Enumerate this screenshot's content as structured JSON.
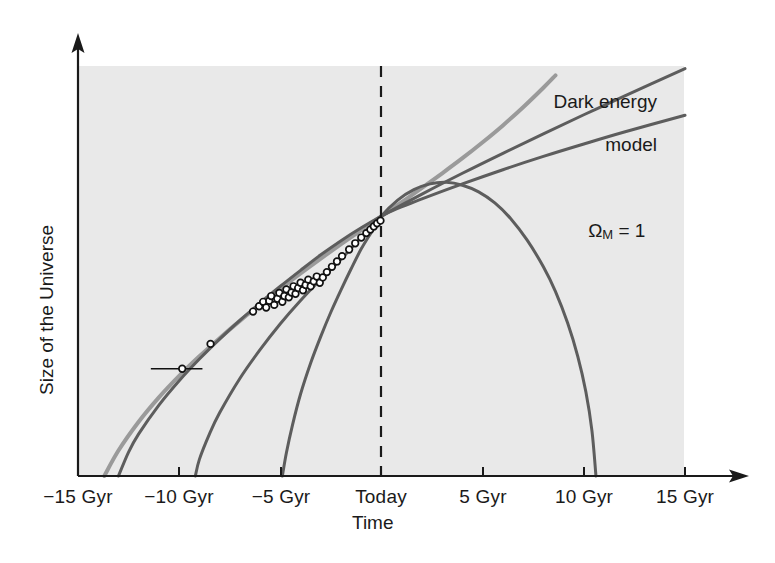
{
  "chart_data": {
    "type": "line",
    "title": "",
    "xlabel": "Time",
    "ylabel": "Size of the Universe",
    "xtick_labels": [
      "-15 Gyr",
      "-10 Gyr",
      "-5 Gyr",
      "Today",
      "5 Gyr",
      "10 Gyr",
      "15 Gyr"
    ],
    "xtick_values": [
      -15,
      -10,
      -5,
      0,
      5,
      10,
      15
    ],
    "xlim": [
      -15,
      15
    ],
    "ylim": [
      0,
      1.85
    ],
    "grid": false,
    "legend_position": "inline-annotations",
    "annotations": [
      {
        "name": "dark-energy-model",
        "text_line1": "Dark energy",
        "text_line2": "model",
        "at_x": 11.0,
        "at_y": 1.62
      },
      {
        "name": "omega-m-1",
        "text_prefix": "Ω",
        "text_sub": "M",
        "text_suffix": " = 1",
        "at_x": 13.0,
        "at_y": 1.02
      }
    ],
    "reference_line": {
      "name": "today-line",
      "x": 0,
      "style": "dashed",
      "label": "Today"
    },
    "series": [
      {
        "name": "Dark energy model",
        "color": "#9a9a9a",
        "style": "solid",
        "width": 4,
        "points": [
          [
            -13.7,
            0.0
          ],
          [
            -13.0,
            0.115
          ],
          [
            -12.0,
            0.245
          ],
          [
            -11.0,
            0.355
          ],
          [
            -10.0,
            0.452
          ],
          [
            -9.0,
            0.54
          ],
          [
            -8.0,
            0.622
          ],
          [
            -7.0,
            0.7
          ],
          [
            -6.0,
            0.774
          ],
          [
            -5.0,
            0.845
          ],
          [
            -4.0,
            0.914
          ],
          [
            -3.0,
            0.981
          ],
          [
            -2.0,
            1.046
          ],
          [
            -1.0,
            1.11
          ],
          [
            0.0,
            1.173
          ],
          [
            1.0,
            1.236
          ],
          [
            2.0,
            1.3
          ],
          [
            3.0,
            1.366
          ],
          [
            4.0,
            1.434
          ],
          [
            5.0,
            1.506
          ],
          [
            6.0,
            1.582
          ],
          [
            7.0,
            1.664
          ],
          [
            8.0,
            1.752
          ],
          [
            8.6,
            1.808
          ]
        ]
      },
      {
        "name": "Open / low density universe",
        "color": "#5d5d5d",
        "style": "solid",
        "width": 3,
        "points": [
          [
            -13.0,
            0.0
          ],
          [
            -12.5,
            0.108
          ],
          [
            -12.0,
            0.19
          ],
          [
            -11.0,
            0.32
          ],
          [
            -10.0,
            0.43
          ],
          [
            -9.0,
            0.528
          ],
          [
            -8.0,
            0.618
          ],
          [
            -7.0,
            0.702
          ],
          [
            -6.0,
            0.781
          ],
          [
            -5.0,
            0.856
          ],
          [
            -4.0,
            0.928
          ],
          [
            -3.0,
            0.998
          ],
          [
            -2.0,
            1.062
          ],
          [
            -1.0,
            1.12
          ],
          [
            0.0,
            1.173
          ],
          [
            2.0,
            1.272
          ],
          [
            4.0,
            1.366
          ],
          [
            6.0,
            1.456
          ],
          [
            8.0,
            1.544
          ],
          [
            10.0,
            1.63
          ],
          [
            12.0,
            1.714
          ],
          [
            15.0,
            1.838
          ]
        ]
      },
      {
        "name": "Omega_M = 1 critical universe",
        "color": "#5d5d5d",
        "style": "solid",
        "width": 3,
        "points": [
          [
            -9.2,
            0.0
          ],
          [
            -9.0,
            0.075
          ],
          [
            -8.5,
            0.19
          ],
          [
            -8.0,
            0.285
          ],
          [
            -7.0,
            0.44
          ],
          [
            -6.0,
            0.57
          ],
          [
            -5.0,
            0.687
          ],
          [
            -4.0,
            0.792
          ],
          [
            -3.0,
            0.888
          ],
          [
            -2.0,
            0.978
          ],
          [
            -1.0,
            1.078
          ],
          [
            0.0,
            1.173
          ],
          [
            2.0,
            1.25
          ],
          [
            4.0,
            1.318
          ],
          [
            6.0,
            1.382
          ],
          [
            8.0,
            1.442
          ],
          [
            10.0,
            1.498
          ],
          [
            12.0,
            1.552
          ],
          [
            15.0,
            1.628
          ]
        ]
      },
      {
        "name": "Closed / high density universe",
        "color": "#5d5d5d",
        "style": "solid",
        "width": 3,
        "points": [
          [
            -4.9,
            0.0
          ],
          [
            -4.7,
            0.105
          ],
          [
            -4.4,
            0.23
          ],
          [
            -4.0,
            0.37
          ],
          [
            -3.5,
            0.51
          ],
          [
            -3.0,
            0.63
          ],
          [
            -2.5,
            0.74
          ],
          [
            -2.0,
            0.84
          ],
          [
            -1.5,
            0.935
          ],
          [
            -1.0,
            1.025
          ],
          [
            -0.5,
            1.1
          ],
          [
            0.0,
            1.173
          ],
          [
            0.8,
            1.245
          ],
          [
            1.6,
            1.292
          ],
          [
            2.4,
            1.318
          ],
          [
            3.2,
            1.325
          ],
          [
            4.0,
            1.312
          ],
          [
            4.8,
            1.282
          ],
          [
            5.6,
            1.232
          ],
          [
            6.4,
            1.16
          ],
          [
            7.2,
            1.064
          ],
          [
            8.0,
            0.944
          ],
          [
            8.6,
            0.832
          ],
          [
            9.2,
            0.69
          ],
          [
            9.7,
            0.54
          ],
          [
            10.1,
            0.38
          ],
          [
            10.4,
            0.205
          ],
          [
            10.6,
            0.0
          ]
        ]
      }
    ],
    "data_points": {
      "name": "supernova-observations",
      "marker": "open-circle",
      "marker_fill": "#ffffff",
      "marker_edge": "#111111",
      "count": 40,
      "error_bar_point": {
        "x": -9.85,
        "y": 0.484,
        "xerr_low": -1.55,
        "xerr_high": 1.0
      },
      "points": [
        [
          -9.85,
          0.484
        ],
        [
          -8.45,
          0.596
        ],
        [
          -6.35,
          0.742
        ],
        [
          -6.05,
          0.766
        ],
        [
          -5.85,
          0.786
        ],
        [
          -5.7,
          0.76
        ],
        [
          -5.55,
          0.79
        ],
        [
          -5.45,
          0.812
        ],
        [
          -5.3,
          0.772
        ],
        [
          -5.15,
          0.8
        ],
        [
          -5.05,
          0.826
        ],
        [
          -4.9,
          0.786
        ],
        [
          -4.8,
          0.812
        ],
        [
          -4.7,
          0.842
        ],
        [
          -4.58,
          0.806
        ],
        [
          -4.45,
          0.828
        ],
        [
          -4.35,
          0.856
        ],
        [
          -4.25,
          0.822
        ],
        [
          -4.12,
          0.848
        ],
        [
          -4.0,
          0.872
        ],
        [
          -3.88,
          0.838
        ],
        [
          -3.75,
          0.862
        ],
        [
          -3.62,
          0.886
        ],
        [
          -3.5,
          0.856
        ],
        [
          -3.35,
          0.878
        ],
        [
          -3.2,
          0.9
        ],
        [
          -3.05,
          0.872
        ],
        [
          -2.9,
          0.896
        ],
        [
          -2.7,
          0.92
        ],
        [
          -2.45,
          0.944
        ],
        [
          -2.2,
          0.968
        ],
        [
          -1.95,
          0.992
        ],
        [
          -1.6,
          1.022
        ],
        [
          -1.3,
          1.05
        ],
        [
          -1.0,
          1.076
        ],
        [
          -0.75,
          1.096
        ],
        [
          -0.55,
          1.112
        ],
        [
          -0.38,
          1.126
        ],
        [
          -0.22,
          1.14
        ],
        [
          -0.05,
          1.152
        ]
      ]
    }
  },
  "axes": {
    "x_axis_name": "time-axis",
    "y_axis_name": "size-axis",
    "x_axis_label": "Time",
    "y_axis_label": "Size of the Universe",
    "ticks": [
      {
        "label": "-15 Gyr",
        "px": 78
      },
      {
        "label": "-10 Gyr",
        "px": 179
      },
      {
        "label": "-5 Gyr",
        "px": 281
      },
      {
        "label": "Today",
        "px": 381
      },
      {
        "label": "5 Gyr",
        "px": 483
      },
      {
        "label": "10 Gyr",
        "px": 584
      },
      {
        "label": "15 Gyr",
        "px": 685
      }
    ]
  },
  "style": {
    "plot_background": "#e9e9e9",
    "page_background": "#ffffff",
    "axis_color": "#1a1a1a",
    "dark_energy_color": "#9a9a9a",
    "model_curve_color": "#5d5d5d",
    "text_color": "#1a1a1a"
  }
}
